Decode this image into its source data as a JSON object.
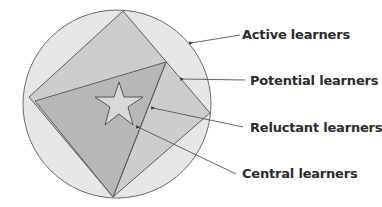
{
  "diagram": {
    "title": "",
    "labels": [
      {
        "id": "active",
        "text": "Active learners"
      },
      {
        "id": "potential",
        "text": "Potential learners"
      },
      {
        "id": "reluctant",
        "text": "Reluctant learners"
      },
      {
        "id": "central",
        "text": "Central learners"
      }
    ],
    "colors": {
      "circle_fill": "#e6e6e6",
      "square_fill": "#cdcdcd",
      "triangle_fill": "#b5b5b5",
      "star_fill": "#d8d8d8",
      "stroke": "#666666",
      "text": "#2b2b2b"
    }
  }
}
